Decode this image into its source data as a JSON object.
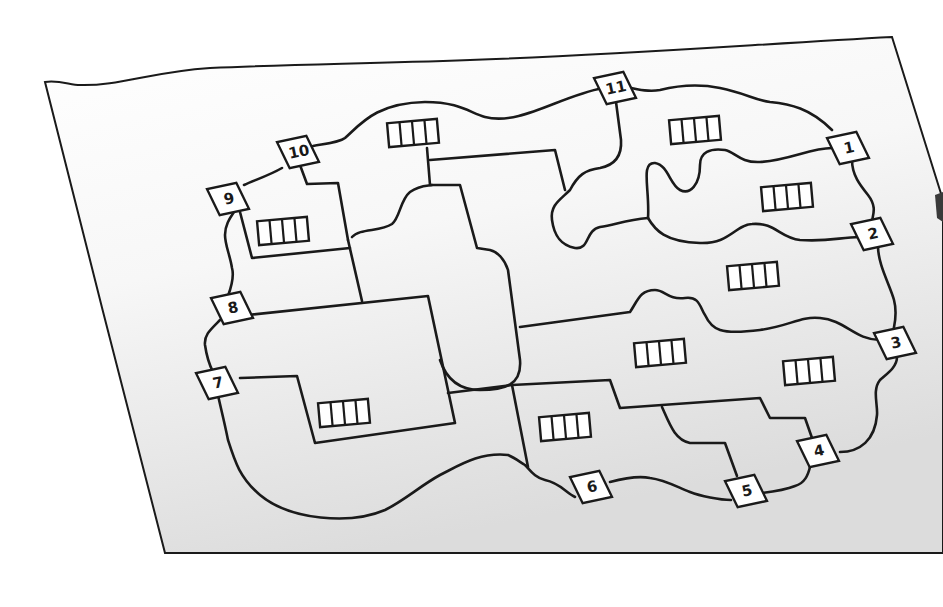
{
  "diagram": {
    "colors": {
      "ink": "#1a1a1a",
      "paper": "#ffffff",
      "paper_shade": "#d9d9d9",
      "background": "#ffffff"
    },
    "markers": [
      {
        "id": "1",
        "label": "1"
      },
      {
        "id": "2",
        "label": "2"
      },
      {
        "id": "3",
        "label": "3"
      },
      {
        "id": "4",
        "label": "4"
      },
      {
        "id": "5",
        "label": "5"
      },
      {
        "id": "6",
        "label": "6"
      },
      {
        "id": "7",
        "label": "7"
      },
      {
        "id": "8",
        "label": "8"
      },
      {
        "id": "9",
        "label": "9"
      },
      {
        "id": "10",
        "label": "10"
      },
      {
        "id": "11",
        "label": "11"
      }
    ],
    "building_symbol": {
      "icon": "building-icon",
      "cells": 4,
      "count": 9
    }
  }
}
